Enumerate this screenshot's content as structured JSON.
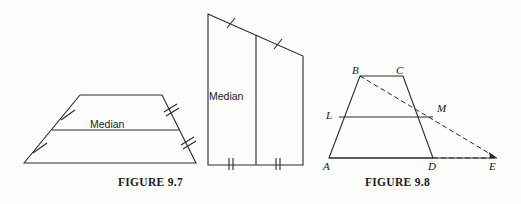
{
  "page": {
    "background_color": "#fdfdfc",
    "ink_color": "#2a2a2a"
  },
  "figures": [
    {
      "id": "figure-9-7",
      "caption": "FIGURE 9.7",
      "description": "Trapezoid with median drawn, legs marked with congruent tick marks",
      "median_label": "Median",
      "shapes": [
        {
          "name": "trapezoid-upright",
          "vertices": [
            [
              24,
              163
            ],
            [
              80,
              95
            ],
            [
              162,
              95
            ],
            [
              196,
              163
            ]
          ],
          "median_endpoints": [
            [
              52,
              130
            ],
            [
              179,
              130
            ]
          ],
          "tick_marks": [
            {
              "leg": "left-lower",
              "count": 1
            },
            {
              "leg": "left-upper",
              "count": 1
            },
            {
              "leg": "right-lower",
              "count": 2
            },
            {
              "leg": "right-upper",
              "count": 2
            }
          ]
        },
        {
          "name": "trapezoid-rotated",
          "vertices": [
            [
              208,
              14
            ],
            [
              303,
              56
            ],
            [
              303,
              165
            ],
            [
              208,
              165
            ]
          ],
          "median_endpoints": [
            [
              256,
              35
            ],
            [
              256,
              165
            ]
          ],
          "tick_marks": [
            {
              "leg": "top-left",
              "count": 1
            },
            {
              "leg": "top-right",
              "count": 1
            },
            {
              "leg": "bottom-left",
              "count": 2
            },
            {
              "leg": "bottom-right",
              "count": 2
            }
          ],
          "median_label": "Median"
        }
      ]
    },
    {
      "id": "figure-9-8",
      "caption": "FIGURE 9.8",
      "description": "Trapezoid ABCD with median LM and dashed auxiliary line from B through M to E on ray AD",
      "points": {
        "A": {
          "label": "A",
          "x": 329,
          "y": 158
        },
        "B": {
          "label": "B",
          "x": 360,
          "y": 76
        },
        "C": {
          "label": "C",
          "x": 403,
          "y": 76
        },
        "D": {
          "label": "D",
          "x": 433,
          "y": 158
        },
        "E": {
          "label": "E",
          "x": 497,
          "y": 158
        },
        "L": {
          "label": "L",
          "x": 339,
          "y": 117
        },
        "M": {
          "label": "M",
          "x": 433,
          "y": 117
        }
      },
      "solid_segments": [
        [
          "A",
          "B"
        ],
        [
          "B",
          "C"
        ],
        [
          "C",
          "D"
        ],
        [
          "A",
          "D"
        ],
        [
          "L",
          "M"
        ]
      ],
      "dashed_segments": [
        [
          "B",
          "E"
        ],
        [
          "D",
          "E"
        ]
      ]
    }
  ]
}
